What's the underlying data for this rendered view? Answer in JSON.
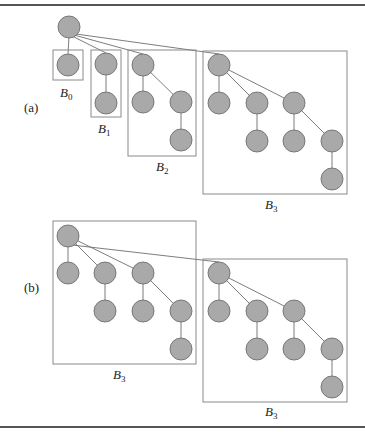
{
  "figure": {
    "panels": [
      {
        "id": "a",
        "label": "(a)",
        "trees": [
          {
            "name": "B",
            "subscript": "0"
          },
          {
            "name": "B",
            "subscript": "1"
          },
          {
            "name": "B",
            "subscript": "2"
          },
          {
            "name": "B",
            "subscript": "3"
          }
        ]
      },
      {
        "id": "b",
        "label": "(b)",
        "trees": [
          {
            "name": "B",
            "subscript": "3"
          },
          {
            "name": "B",
            "subscript": "3"
          }
        ]
      }
    ],
    "colors": {
      "node_fill": "#a9a9a9",
      "node_stroke": "#6f6f6f",
      "box_stroke": "#8a8a8a",
      "rule": "#555555"
    }
  }
}
